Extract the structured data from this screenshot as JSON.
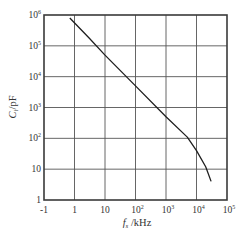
{
  "chart_data": {
    "type": "line",
    "title": "",
    "xlabel": "f_s /kHz",
    "ylabel": "C_i /pF",
    "x_scale": "log",
    "y_scale": "log",
    "x_tick_labels": [
      "-1",
      "1",
      "10",
      "10^2",
      "10^3",
      "10^4",
      "10^5"
    ],
    "y_tick_labels": [
      "1",
      "10",
      "10^2",
      "10^3",
      "10^4",
      "10^5",
      "10^6"
    ],
    "x_ticks": [
      {
        "base": "-1",
        "exp": ""
      },
      {
        "base": "1",
        "exp": ""
      },
      {
        "base": "10",
        "exp": ""
      },
      {
        "base": "10",
        "exp": "2"
      },
      {
        "base": "10",
        "exp": "3"
      },
      {
        "base": "10",
        "exp": "4"
      },
      {
        "base": "10",
        "exp": "5"
      }
    ],
    "y_ticks": [
      {
        "base": "1",
        "exp": ""
      },
      {
        "base": "10",
        "exp": ""
      },
      {
        "base": "10",
        "exp": "2"
      },
      {
        "base": "10",
        "exp": "3"
      },
      {
        "base": "10",
        "exp": "4"
      },
      {
        "base": "10",
        "exp": "5"
      },
      {
        "base": "10",
        "exp": "6"
      }
    ],
    "grid": true,
    "legend": null,
    "series": [
      {
        "name": "C_i vs f_s",
        "x": [
          0.7,
          3,
          10,
          100,
          1000,
          5000,
          10000,
          20000,
          30000
        ],
        "y": [
          800000,
          180000,
          50000,
          5000,
          500,
          110,
          40,
          12,
          4
        ]
      }
    ]
  },
  "axes": {
    "x_label_main": "f",
    "x_label_sub": "s",
    "x_label_unit": " /kHz",
    "y_label_main": "C",
    "y_label_sub": "i",
    "y_label_unit": "/pF"
  },
  "colors": {
    "frame": "#3a3a3a",
    "grid": "#555555",
    "curve": "#1e1e1e",
    "text": "#333333"
  }
}
